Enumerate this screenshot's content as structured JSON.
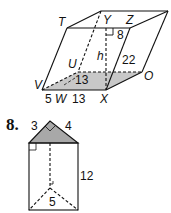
{
  "figure1": {
    "vertices": {
      "T": "T",
      "Y": "Y",
      "Z": "Z",
      "U": "U",
      "V": "V",
      "W": "W",
      "X": "X",
      "O": "O"
    },
    "height_label": "h",
    "measures": {
      "top_offset": "8",
      "slant_edge": "22",
      "base_diag": "13",
      "base_left": "5",
      "base_right": "13"
    },
    "base_fill": "#c8c8c8"
  },
  "figure2": {
    "exercise_number": "8.",
    "measures": {
      "leg_a": "3",
      "leg_b": "4",
      "height": "12",
      "bottom": "5"
    },
    "top_fill": "#a8a8a8"
  }
}
